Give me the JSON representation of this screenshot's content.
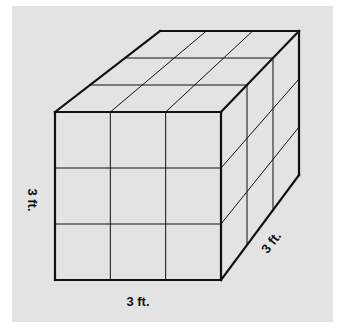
{
  "diagram": {
    "colors": {
      "page": "#ffffff",
      "panel": "#e3e3e3",
      "stroke": "#111111"
    },
    "panel": {
      "x": 12,
      "y": 6,
      "w": 321,
      "h": 316
    },
    "vertices": {
      "front_tl": [
        55,
        112
      ],
      "front_tr": [
        221,
        112
      ],
      "front_br": [
        221,
        280
      ],
      "front_bl": [
        55,
        280
      ],
      "back_tl": [
        160,
        31
      ],
      "back_tr": [
        299,
        31
      ],
      "back_br": [
        299,
        175
      ]
    },
    "divisions": 3,
    "labels": {
      "height": {
        "text": "3 ft.",
        "x": 31,
        "y": 200,
        "rotate": 90
      },
      "width": {
        "text": "3 ft.",
        "x": 138,
        "y": 303,
        "rotate": 0
      },
      "depth": {
        "text": "3 ft.",
        "x": 272,
        "y": 243,
        "rotate": -52
      }
    }
  }
}
